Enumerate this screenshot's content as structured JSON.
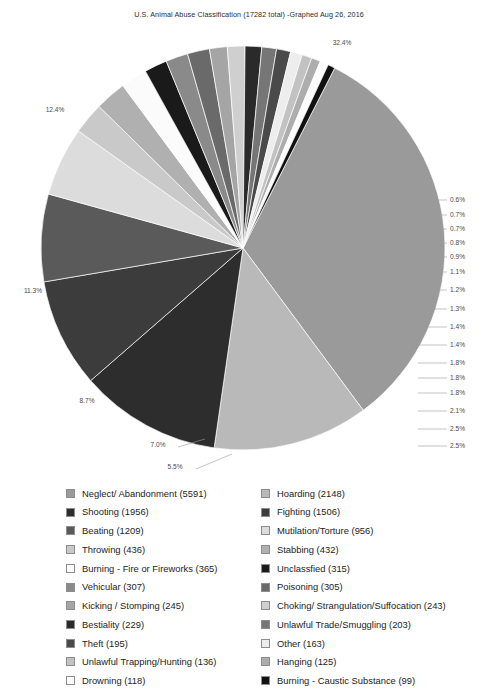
{
  "title": "U.S. Animal Abuse Classification (17282 total) -Graphed Aug 26, 2016",
  "chart_data": {
    "type": "pie",
    "title": "U.S. Animal Abuse Classification (17282 total) -Graphed Aug 26, 2016",
    "total": 17282,
    "total_label": "17282 total",
    "date_label": "Graphed Aug 26, 2016",
    "legend_position": "bottom",
    "grid": false,
    "xlabel": "",
    "ylabel": "",
    "categories": [
      "Neglect/ Abandonment",
      "Hoarding",
      "Shooting",
      "Fighting",
      "Beating",
      "Mutilation/Torture",
      "Throwing",
      "Stabbing",
      "Burning - Fire or Fireworks",
      "Unclassfied",
      "Vehicular",
      "Poisoning",
      "Kicking / Stomping",
      "Choking/ Strangulation/Suffocation",
      "Bestiality",
      "Unlawful Trade/Smuggling",
      "Theft",
      "Other",
      "Unlawful Trapping/Hunting",
      "Hanging",
      "Drowning",
      "Burning - Caustic Substance"
    ],
    "values": [
      5591,
      2148,
      1956,
      1506,
      1209,
      956,
      436,
      432,
      365,
      315,
      307,
      305,
      245,
      243,
      229,
      203,
      195,
      163,
      136,
      125,
      118,
      99
    ],
    "percentages": [
      "32.4%",
      "12.4%",
      "11.3%",
      "8.7%",
      "7.0%",
      "5.5%",
      "2.5%",
      "2.5%",
      "2.1%",
      "1.8%",
      "1.8%",
      "1.8%",
      "1.4%",
      "1.4%",
      "1.3%",
      "1.2%",
      "1.1%",
      "0.9%",
      "0.8%",
      "0.7%",
      "0.7%",
      "0.6%"
    ],
    "colors": [
      "#9a9a9a",
      "#b9b9b9",
      "#2d2d2d",
      "#3c3c3c",
      "#5a5a5a",
      "#dcdcdc",
      "#c9c9c9",
      "#b0b0b0",
      "#fbfbfb",
      "#1a1a1a",
      "#8a8a8a",
      "#6a6a6a",
      "#a5a5a5",
      "#cfcfcf",
      "#2a2a2a",
      "#767676",
      "#4a4a4a",
      "#ededed",
      "#c2c2c2",
      "#adadad",
      "#fcfcfc",
      "#111111"
    ]
  },
  "pie_labels_outside": [
    {
      "pct": "32.4%",
      "x": 342,
      "y": 45
    },
    {
      "pct": "12.4%",
      "x": 55,
      "y": 112
    },
    {
      "pct": "11.3%",
      "x": 33,
      "y": 293
    },
    {
      "pct": "8.7%",
      "x": 87,
      "y": 403
    },
    {
      "pct": "7.0%",
      "x": 158,
      "y": 447
    },
    {
      "pct": "5.5%",
      "x": 175,
      "y": 469
    }
  ],
  "pie_labels_right": [
    {
      "pct": "0.6%",
      "y": 200
    },
    {
      "pct": "0.7%",
      "y": 215
    },
    {
      "pct": "0.7%",
      "y": 229
    },
    {
      "pct": "0.8%",
      "y": 243
    },
    {
      "pct": "0.9%",
      "y": 257
    },
    {
      "pct": "1.1%",
      "y": 272
    },
    {
      "pct": "1.2%",
      "y": 290
    },
    {
      "pct": "1.3%",
      "y": 309
    },
    {
      "pct": "1.4%",
      "y": 327
    },
    {
      "pct": "1.4%",
      "y": 345
    },
    {
      "pct": "1.8%",
      "y": 363
    },
    {
      "pct": "1.8%",
      "y": 378
    },
    {
      "pct": "1.8%",
      "y": 393
    },
    {
      "pct": "2.1%",
      "y": 411
    },
    {
      "pct": "2.5%",
      "y": 429
    },
    {
      "pct": "2.5%",
      "y": 446
    }
  ],
  "legend": {
    "left_column": [
      {
        "label": "Neglect/ Abandonment (5591)",
        "color": "#9a9a9a"
      },
      {
        "label": "Shooting (1956)",
        "color": "#2d2d2d"
      },
      {
        "label": "Beating (1209)",
        "color": "#5a5a5a"
      },
      {
        "label": "Throwing (436)",
        "color": "#c9c9c9"
      },
      {
        "label": "Burning - Fire or Fireworks (365)",
        "color": "#fbfbfb"
      },
      {
        "label": "Vehicular (307)",
        "color": "#8a8a8a"
      },
      {
        "label": "Kicking / Stomping (245)",
        "color": "#a5a5a5"
      },
      {
        "label": "Bestiality (229)",
        "color": "#2a2a2a"
      },
      {
        "label": "Theft (195)",
        "color": "#4a4a4a"
      },
      {
        "label": "Unlawful Trapping/Hunting (136)",
        "color": "#c2c2c2"
      },
      {
        "label": "Drowning (118)",
        "color": "#fcfcfc"
      }
    ],
    "right_column": [
      {
        "label": "Hoarding (2148)",
        "color": "#b9b9b9"
      },
      {
        "label": "Fighting (1506)",
        "color": "#3c3c3c"
      },
      {
        "label": "Mutilation/Torture (956)",
        "color": "#dcdcdc"
      },
      {
        "label": "Stabbing (432)",
        "color": "#b0b0b0"
      },
      {
        "label": "Unclassfied (315)",
        "color": "#1a1a1a"
      },
      {
        "label": "Poisoning (305)",
        "color": "#6a6a6a"
      },
      {
        "label": "Choking/ Strangulation/Suffocation (243)",
        "color": "#cfcfcf"
      },
      {
        "label": "Unlawful Trade/Smuggling (203)",
        "color": "#767676"
      },
      {
        "label": "Other (163)",
        "color": "#ededed"
      },
      {
        "label": "Hanging (125)",
        "color": "#adadad"
      },
      {
        "label": "Burning - Caustic Substance (99)",
        "color": "#111111"
      }
    ]
  }
}
